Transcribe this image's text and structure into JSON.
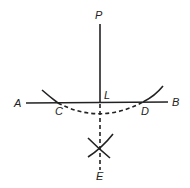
{
  "diagram": {
    "title": "",
    "labels": {
      "P": "P",
      "A": "A",
      "B": "B",
      "L": "L",
      "C": "C",
      "D": "D",
      "E": "E"
    },
    "colors": {
      "stroke": "#222222",
      "background": "#ffffff"
    }
  }
}
